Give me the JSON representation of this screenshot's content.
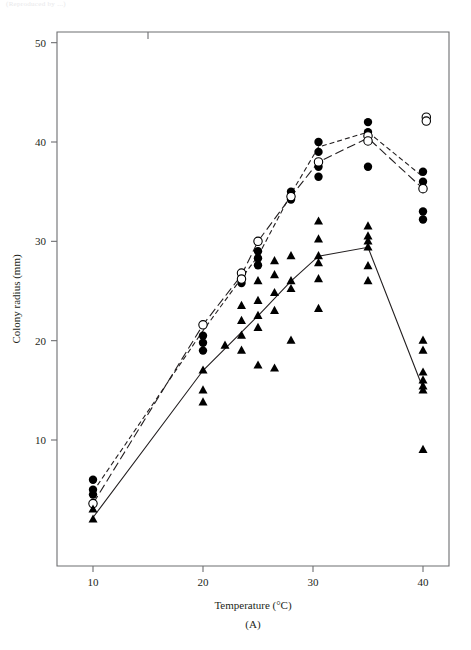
{
  "figure": {
    "panel_label": "(A)",
    "cut_caption": "(Reproduced by ...)"
  },
  "chart_data": {
    "type": "scatter",
    "title": "",
    "xlabel": "Temperature (°C)",
    "ylabel": "Colony radius (mm)",
    "xlim": [
      7.5,
      42.5
    ],
    "ylim": [
      0,
      52
    ],
    "xticks": [
      10,
      20,
      30,
      40
    ],
    "yticks": [
      10,
      20,
      30,
      40,
      50
    ],
    "xtick_labels": [
      "10",
      "20",
      "30",
      "40"
    ],
    "ytick_labels": [
      "10",
      "20",
      "30",
      "40",
      "50"
    ],
    "grid": false,
    "legend": "none",
    "series": [
      {
        "name": "series-filled-circle",
        "marker": "filled-circle",
        "line_style": "dashed-short",
        "line_x": [
          10,
          20,
          23.5,
          25,
          28,
          30.5,
          35,
          40
        ],
        "line_y": [
          4.8,
          21.0,
          26.3,
          28.5,
          34.8,
          39.5,
          41.0,
          36.5
        ],
        "points_x": [
          10,
          10,
          10,
          20,
          20,
          20,
          23.5,
          23.5,
          25,
          25,
          25,
          28,
          28,
          30.5,
          30.5,
          30.5,
          30.5,
          35,
          35,
          35,
          35,
          35,
          40,
          40,
          40,
          40
        ],
        "points_y": [
          6.0,
          5.0,
          4.5,
          20.5,
          19.8,
          19.0,
          26.3,
          25.8,
          29.0,
          28.3,
          27.6,
          35.0,
          34.2,
          40.0,
          39.0,
          37.5,
          36.5,
          42.0,
          41.0,
          40.6,
          40.2,
          37.5,
          37.0,
          36.0,
          33.0,
          32.2
        ]
      },
      {
        "name": "series-open-circle",
        "marker": "open-circle",
        "line_style": "dashed-long",
        "line_x": [
          10,
          20,
          23.5,
          25,
          28,
          30.5,
          35,
          40
        ],
        "line_y": [
          3.6,
          21.6,
          26.6,
          30.0,
          34.5,
          38.0,
          40.4,
          35.3
        ],
        "points_x": [
          10,
          20,
          23.5,
          23.5,
          25,
          28,
          30.5,
          35,
          35,
          40,
          40.3,
          40.3
        ],
        "points_y": [
          3.6,
          21.6,
          26.8,
          26.2,
          30.0,
          34.5,
          38.0,
          40.6,
          40.1,
          35.3,
          42.5,
          42.1
        ]
      },
      {
        "name": "series-filled-triangle",
        "marker": "filled-triangle",
        "line_style": "solid",
        "line_x": [
          10,
          20,
          25,
          28,
          30.5,
          35,
          40
        ],
        "line_y": [
          2.2,
          17.0,
          22.5,
          26.0,
          28.5,
          29.4,
          15.2
        ],
        "points_x": [
          10,
          10,
          20,
          20,
          20,
          22,
          23.5,
          23.5,
          23.5,
          23.5,
          25,
          25,
          25,
          25,
          25,
          26.5,
          26.5,
          26.5,
          26.5,
          26.5,
          28,
          28,
          28,
          28,
          30.5,
          30.5,
          30.5,
          30.5,
          30.5,
          30.5,
          35,
          35,
          35,
          35,
          35,
          35,
          40,
          40,
          40,
          40,
          40,
          40,
          40
        ],
        "points_y": [
          3.0,
          2.0,
          17.0,
          15.0,
          13.8,
          19.5,
          23.5,
          22.0,
          20.5,
          19.0,
          26.0,
          24.0,
          22.5,
          21.3,
          17.5,
          28.0,
          26.6,
          24.8,
          23.0,
          17.2,
          28.5,
          26.0,
          25.2,
          20.0,
          32.0,
          30.2,
          28.5,
          27.8,
          26.2,
          23.2,
          31.5,
          30.5,
          30.0,
          29.4,
          27.5,
          26.0,
          20.0,
          19.0,
          16.8,
          16.0,
          15.4,
          15.0,
          9.0
        ]
      }
    ]
  }
}
